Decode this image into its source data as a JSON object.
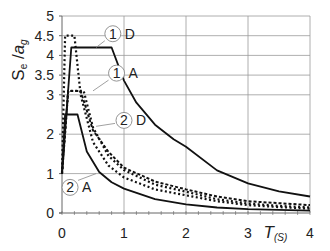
{
  "chart_data": {
    "type": "line",
    "title": "",
    "xlabel": "T",
    "xlabel_sub": "(S)",
    "ylabel": "Se /ag",
    "ylabel_parts": {
      "S": "S",
      "S_sub": "e",
      "slash": " /",
      "a": "a",
      "a_sub": "g"
    },
    "xlim": [
      0,
      4
    ],
    "ylim": [
      0,
      5
    ],
    "x_ticks": [
      "0",
      "1",
      "2",
      "3",
      "4"
    ],
    "y_ticks": [
      "0",
      "1",
      "2",
      "3",
      "3.5",
      "4",
      "4.5",
      "5"
    ],
    "grid": true,
    "legend": "inline annotations",
    "series": [
      {
        "name": "1 D",
        "label_num": "1",
        "label_letter": "D",
        "style": "solid",
        "points": [
          [
            0,
            1.0
          ],
          [
            0.15,
            4.2
          ],
          [
            0.8,
            4.2
          ],
          [
            1.0,
            3.36
          ],
          [
            1.2,
            2.8
          ],
          [
            1.5,
            2.24
          ],
          [
            1.8,
            1.87
          ],
          [
            2.0,
            1.68
          ],
          [
            2.5,
            1.08
          ],
          [
            3.0,
            0.75
          ],
          [
            3.5,
            0.55
          ],
          [
            4.0,
            0.42
          ]
        ]
      },
      {
        "name": "1 A",
        "label_num": "1",
        "label_letter": "A",
        "style": "dotted",
        "points": [
          [
            0,
            1.0
          ],
          [
            0.1,
            3.1
          ],
          [
            0.35,
            3.1
          ],
          [
            0.5,
            2.17
          ],
          [
            0.75,
            1.45
          ],
          [
            1.0,
            1.09
          ],
          [
            1.5,
            0.72
          ],
          [
            2.0,
            0.54
          ],
          [
            2.5,
            0.35
          ],
          [
            3.0,
            0.24
          ],
          [
            3.5,
            0.18
          ],
          [
            4.0,
            0.14
          ]
        ]
      },
      {
        "name": "1 high (dotted)",
        "label_num": "",
        "label_letter": "",
        "style": "dotted",
        "points": [
          [
            0,
            1.0
          ],
          [
            0.05,
            4.5
          ],
          [
            0.2,
            4.5
          ],
          [
            0.3,
            3.0
          ],
          [
            0.5,
            1.8
          ],
          [
            0.75,
            1.2
          ],
          [
            1.0,
            0.9
          ],
          [
            1.5,
            0.6
          ],
          [
            2.0,
            0.45
          ],
          [
            2.5,
            0.3
          ],
          [
            3.0,
            0.2
          ],
          [
            3.5,
            0.15
          ],
          [
            4.0,
            0.11
          ]
        ]
      },
      {
        "name": "2 D",
        "label_num": "2",
        "label_letter": "D",
        "style": "dashed",
        "points": [
          [
            0,
            1.0
          ],
          [
            0.1,
            3.1
          ],
          [
            0.3,
            3.1
          ],
          [
            0.5,
            2.1
          ],
          [
            0.75,
            1.55
          ],
          [
            1.0,
            1.15
          ],
          [
            1.5,
            0.8
          ],
          [
            2.0,
            0.6
          ],
          [
            2.5,
            0.42
          ],
          [
            3.0,
            0.3
          ],
          [
            3.5,
            0.25
          ],
          [
            4.0,
            0.2
          ]
        ]
      },
      {
        "name": "2 A",
        "label_num": "2",
        "label_letter": "A",
        "style": "solid",
        "points": [
          [
            0,
            1.0
          ],
          [
            0.05,
            2.5
          ],
          [
            0.25,
            2.5
          ],
          [
            0.4,
            1.56
          ],
          [
            0.6,
            1.04
          ],
          [
            0.8,
            0.78
          ],
          [
            1.0,
            0.62
          ],
          [
            1.5,
            0.35
          ],
          [
            2.0,
            0.22
          ],
          [
            2.5,
            0.14
          ],
          [
            3.0,
            0.1
          ],
          [
            3.5,
            0.08
          ],
          [
            4.0,
            0.06
          ]
        ]
      }
    ],
    "annotations": [
      {
        "num": "1",
        "letter": "D",
        "x": 0.82,
        "y": 4.55
      },
      {
        "num": "1",
        "letter": "A",
        "x": 0.88,
        "y": 3.55
      },
      {
        "num": "2",
        "letter": "D",
        "x": 1.0,
        "y": 2.35
      },
      {
        "num": "2",
        "letter": "A",
        "x": 0.13,
        "y": 0.65
      }
    ]
  }
}
